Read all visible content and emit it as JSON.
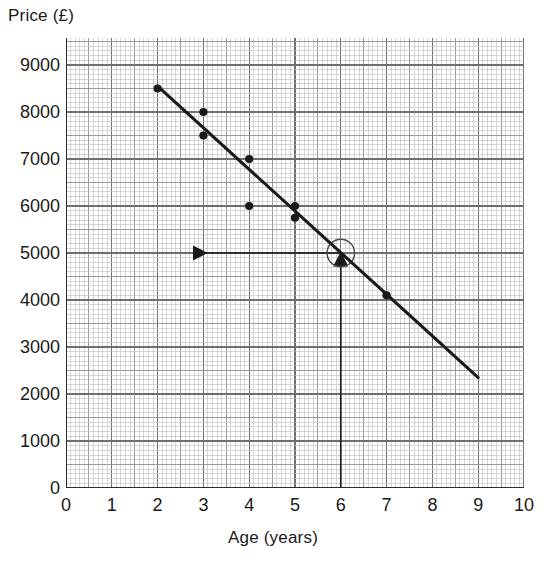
{
  "chart_data": {
    "type": "scatter",
    "title": "",
    "xlabel": "Age (years)",
    "ylabel": "Price (£)",
    "xlim": [
      0,
      10
    ],
    "ylim": [
      0,
      9500
    ],
    "grid": true,
    "grid_style": "graph-paper (minor 0.1 units / 100 £, major 0.5 units / 500 £, bold 1 unit / 1000 £)",
    "legend": "none",
    "x_tick_labels": [
      "0",
      "1",
      "2",
      "3",
      "4",
      "5",
      "6",
      "7",
      "8",
      "9",
      "10"
    ],
    "x_ticks": [
      0,
      1,
      2,
      3,
      4,
      5,
      6,
      7,
      8,
      9,
      10
    ],
    "y_tick_labels": [
      "0",
      "1000",
      "2000",
      "3000",
      "4000",
      "5000",
      "6000",
      "7000",
      "8000",
      "9000"
    ],
    "y_ticks": [
      0,
      1000,
      2000,
      3000,
      4000,
      5000,
      6000,
      7000,
      8000,
      9000
    ],
    "points": [
      {
        "x": 2,
        "y": 8500
      },
      {
        "x": 3,
        "y": 8000
      },
      {
        "x": 3,
        "y": 7500
      },
      {
        "x": 4,
        "y": 7000
      },
      {
        "x": 4,
        "y": 6000
      },
      {
        "x": 5,
        "y": 6000
      },
      {
        "x": 5,
        "y": 5750
      },
      {
        "x": 7,
        "y": 4100
      }
    ],
    "series": [
      {
        "name": "Line of best fit",
        "type": "line",
        "x_start": 2.0,
        "y_start": 8550,
        "x_end": 9.0,
        "y_end": 2350
      }
    ],
    "annotations": [
      {
        "name": "reading-circle",
        "shape": "circle",
        "x": 6,
        "y": 5000,
        "radius_units_x": 0.3,
        "radius_units_y": 285
      },
      {
        "name": "vertical-read-arrow",
        "shape": "arrow",
        "from_x": 6,
        "from_y": 0,
        "to_x": 6,
        "to_y": 5000,
        "direction": "up"
      },
      {
        "name": "horizontal-read-arrow",
        "shape": "arrow",
        "from_x": 6,
        "from_y": 5000,
        "to_x": 2.8,
        "to_y": 5000,
        "direction": "left"
      }
    ]
  },
  "axes": {
    "y_title": "Price (£)",
    "x_title": "Age (years)"
  },
  "colors": {
    "ink": "#1a1a1a",
    "grid_minor": "#b9bcc4",
    "grid_major": "#8d9199",
    "grid_bold": "#6b7077",
    "axis": "#2a2a2a",
    "background": "#ffffff"
  }
}
